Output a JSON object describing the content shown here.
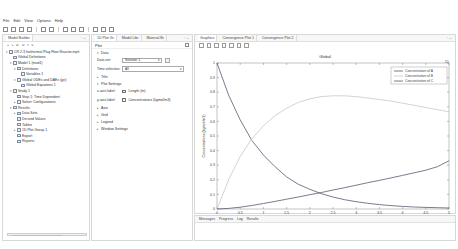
{
  "menu": [
    "File",
    "Edit",
    "View",
    "Options",
    "Help"
  ],
  "model_builder": {
    "title": "Model Builder",
    "tree": [
      {
        "label": "CR 2.3 Isothermal Plug Flow Reactor.mph",
        "level": 0,
        "arrow": "▾"
      },
      {
        "label": "Global Definitions",
        "level": 1,
        "arrow": ""
      },
      {
        "label": "Model 1 (mod1)",
        "level": 1,
        "arrow": "▾"
      },
      {
        "label": "Definitions",
        "level": 2,
        "arrow": "▾"
      },
      {
        "label": "Variables 1",
        "level": 3,
        "arrow": ""
      },
      {
        "label": "Global ODEs and DAEs (ge)",
        "level": 2,
        "arrow": "▾"
      },
      {
        "label": "Global Equations 1",
        "level": 3,
        "arrow": ""
      },
      {
        "label": "Study 1",
        "level": 1,
        "arrow": "▾"
      },
      {
        "label": "Step 1: Time Dependent",
        "level": 2,
        "arrow": ""
      },
      {
        "label": "Solver Configurations",
        "level": 2,
        "arrow": "▸"
      },
      {
        "label": "Results",
        "level": 1,
        "arrow": "▾"
      },
      {
        "label": "Data Sets",
        "level": 2,
        "arrow": "▸"
      },
      {
        "label": "Derived Values",
        "level": 2,
        "arrow": ""
      },
      {
        "label": "Tables",
        "level": 2,
        "arrow": ""
      },
      {
        "label": "1D Plot Group 1",
        "level": 2,
        "arrow": "▸"
      },
      {
        "label": "Export",
        "level": 2,
        "arrow": ""
      },
      {
        "label": "Reports",
        "level": 2,
        "arrow": ""
      }
    ]
  },
  "settings": {
    "tabs": [
      "1D Plot Gr",
      "Model Libr",
      "Material Br"
    ],
    "title": "Plot",
    "sections": {
      "data": "Data",
      "title": "Title",
      "plot_settings": "Plot Settings",
      "axis": "Axis",
      "grid": "Grid",
      "legend": "Legend",
      "window_settings": "Window Settings"
    },
    "data_set_label": "Data set:",
    "data_set_value": "Solution 1",
    "time_selection_label": "Time selection:",
    "time_selection_value": "All",
    "x_axis_label": "x-axis label:",
    "x_axis_value": "Length (m)",
    "y_axis_label": "y-axis label:",
    "y_axis_value": "Concentrations (kgmol/m3)"
  },
  "graphics": {
    "tabs": [
      "Graphics",
      "Convergence Plot 1",
      "Convergence Plot 2"
    ],
    "plot_title": "Global",
    "tag": "1D"
  },
  "messages": {
    "tabs": [
      "Messages",
      "Progress",
      "Log",
      "Results"
    ]
  },
  "chart_data": {
    "type": "line",
    "title": "Global",
    "xlabel": "Length (m)",
    "ylabel": "Concentrations (kgmol/m3)",
    "xlim": [
      0,
      5
    ],
    "ylim": [
      0,
      1
    ],
    "x_ticks": [
      "0",
      "0.5",
      "1",
      "1.5",
      "2",
      "2.5",
      "3",
      "3.5",
      "4",
      "4.5",
      "5"
    ],
    "y_ticks": [
      "0",
      "0.1",
      "0.2",
      "0.3",
      "0.4",
      "0.5",
      "0.6",
      "0.7",
      "0.8",
      "0.9",
      "1"
    ],
    "x": [
      0,
      0.25,
      0.5,
      0.75,
      1,
      1.25,
      1.5,
      1.75,
      2,
      2.25,
      2.5,
      2.75,
      3,
      3.25,
      3.5,
      3.75,
      4,
      4.25,
      4.5,
      4.75,
      5
    ],
    "series": [
      {
        "name": "Concentration of A",
        "color": "#555a70",
        "values": [
          1.0,
          0.78,
          0.61,
          0.47,
          0.37,
          0.29,
          0.22,
          0.17,
          0.135,
          0.105,
          0.082,
          0.064,
          0.05,
          0.039,
          0.03,
          0.023,
          0.018,
          0.014,
          0.011,
          0.009,
          0.007
        ]
      },
      {
        "name": "Concentration of B",
        "color": "#c8c8c8",
        "values": [
          0.0,
          0.2,
          0.36,
          0.48,
          0.57,
          0.64,
          0.69,
          0.73,
          0.755,
          0.77,
          0.775,
          0.775,
          0.77,
          0.76,
          0.75,
          0.74,
          0.725,
          0.71,
          0.695,
          0.68,
          0.665
        ]
      },
      {
        "name": "Concentration of C",
        "color": "#555a70",
        "values": [
          0.0,
          0.004,
          0.012,
          0.024,
          0.038,
          0.052,
          0.067,
          0.082,
          0.098,
          0.113,
          0.13,
          0.146,
          0.163,
          0.18,
          0.196,
          0.213,
          0.23,
          0.248,
          0.266,
          0.29,
          0.33
        ]
      }
    ],
    "legend_position": "top-right",
    "grid": false
  }
}
